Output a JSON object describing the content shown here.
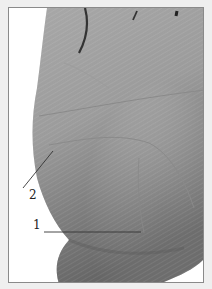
{
  "figure": {
    "labels": [
      {
        "id": "1",
        "text": "1"
      },
      {
        "id": "2",
        "text": "2"
      }
    ],
    "colors": {
      "background": "#efefef",
      "frame_border": "#8a8a8a",
      "skin_light": "#c9c9c9",
      "skin_mid": "#a9a9a9",
      "skin_dark": "#6e6e6e",
      "leader_line": "#333333"
    }
  }
}
